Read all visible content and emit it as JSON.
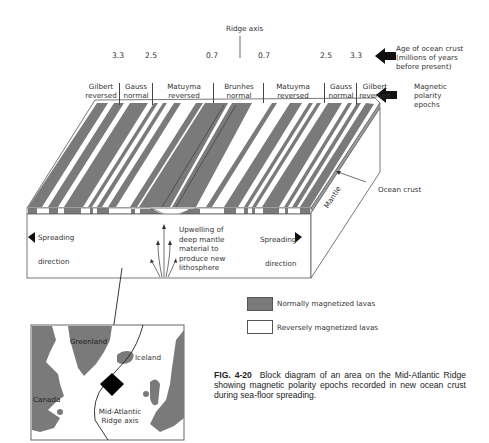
{
  "ridge_axis": {
    "label": "Ridge axis"
  },
  "ages": {
    "values_left": [
      "3.3",
      "2.5",
      "0.7"
    ],
    "values_right": [
      "0.7",
      "2.5",
      "3.3"
    ],
    "legend_label_line1": "Age of ocean crust",
    "legend_label_line2": "(millions of years",
    "legend_label_line3": "before present)"
  },
  "epochs": {
    "items": [
      {
        "name": "Gilbert",
        "polarity": "reversed"
      },
      {
        "name": "Gauss",
        "polarity": "normal"
      },
      {
        "name": "Matuyma",
        "polarity": "reversed"
      },
      {
        "name": "Brunhes",
        "polarity": "normal"
      },
      {
        "name": "Matuyma",
        "polarity": "reversed"
      },
      {
        "name": "Gauss",
        "polarity": "normal"
      },
      {
        "name": "Gilbert",
        "polarity": "reversed"
      }
    ],
    "legend_label_line1": "Magnetic",
    "legend_label_line2": "polarity",
    "legend_label_line3": "epochs"
  },
  "block": {
    "ocean_crust_label": "Ocean crust",
    "mantle_label": "Mantle",
    "spreading_left_line1": "Spreading",
    "spreading_left_line2": "direction",
    "spreading_right_line1": "Spreading",
    "spreading_right_line2": "direction",
    "upwelling_lines": [
      "Upwelling of",
      "deep mantle",
      "material to",
      "produce new",
      "lithosphere"
    ]
  },
  "legend": {
    "normal_label": "Normally magnetized lavas",
    "reverse_label": "Reversely magnetized lavas",
    "normal_color": "#7a7a7a",
    "reverse_color": "#ffffff"
  },
  "map": {
    "labels": {
      "greenland": "Greenland",
      "iceland": "Iceland",
      "canada": "Canada",
      "ridge_line1": "Mid-Atlantic",
      "ridge_line2": "Ridge axis"
    }
  },
  "caption": {
    "fig_number": "FIG. 4-20",
    "text": "Block diagram of an area on the Mid-Atlantic Ridge showing magnetic polarity epochs recorded in new ocean crust during sea-floor spreading."
  }
}
